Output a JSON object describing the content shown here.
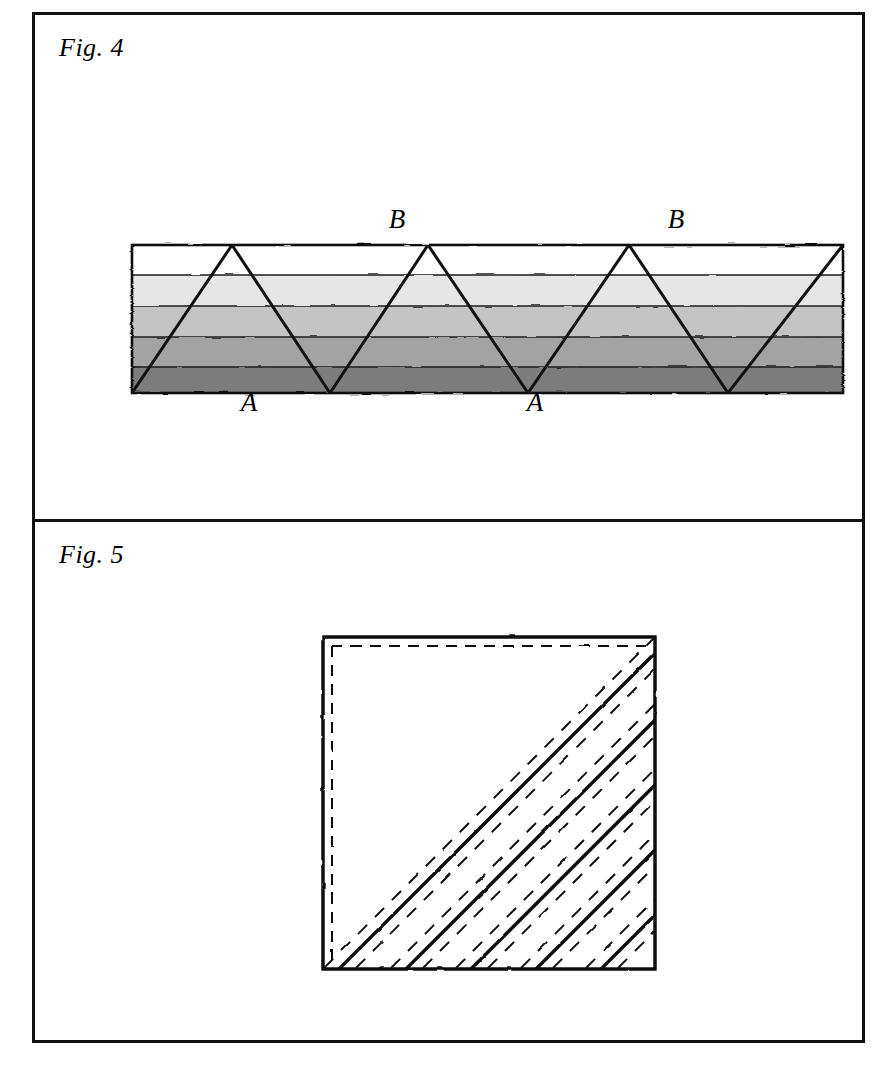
{
  "plate": {
    "background_color": "#ffffff",
    "border_color": "#111111"
  },
  "figures": [
    {
      "id": "fig4",
      "caption": "Fig. 4",
      "description": "Horizontal layered band with five grey-scale strata crossed by a zigzag (sawtooth) trace",
      "labels": [
        {
          "text": "B",
          "role": "crest-label",
          "x": 368,
          "y": 213
        },
        {
          "text": "B",
          "role": "crest-label",
          "x": 645,
          "y": 213
        },
        {
          "text": "A",
          "role": "trough-label",
          "x": 216,
          "y": 392
        },
        {
          "text": "A",
          "role": "trough-label",
          "x": 500,
          "y": 392
        }
      ],
      "band": {
        "left": 97,
        "right": 808,
        "top": 230,
        "bottom": 378,
        "stripes": [
          {
            "name": "stratum-1",
            "color": "#ffffff",
            "top": 230,
            "bottom": 260
          },
          {
            "name": "stratum-2",
            "color": "#e6e6e6",
            "top": 260,
            "bottom": 291
          },
          {
            "name": "stratum-3",
            "color": "#c4c4c4",
            "top": 291,
            "bottom": 322
          },
          {
            "name": "stratum-4",
            "color": "#a3a3a3",
            "top": 322,
            "bottom": 352
          },
          {
            "name": "stratum-5",
            "color": "#7d7d7d",
            "top": 352,
            "bottom": 378
          }
        ]
      },
      "zigzag": {
        "stroke_color": "#111111",
        "stroke_width": 3,
        "points": "97,378 197,230 295,378 393,230 493,378 594,230 693,378 808,230"
      }
    },
    {
      "id": "fig5",
      "caption": "Fig. 5",
      "description": "Square outline with an inset dashed margin along the top and left edges and a family of solid 45 degree diagonals each flanked by dashed diagonals",
      "square": {
        "left": 288,
        "top": 115,
        "size": 332,
        "stroke_color": "#111111",
        "stroke_width": 3
      },
      "inner_dashed_margin": {
        "inset": 9,
        "stroke_color": "#111111",
        "stroke_width": 2,
        "dash_pattern": "11 8",
        "edges": [
          "top",
          "left"
        ]
      },
      "diagonals": {
        "angle_degrees": 45,
        "direction": "lower-left to upper-right",
        "solid_count": 5,
        "solid_stroke_color": "#111111",
        "solid_stroke_width": 3.4,
        "dashed_stroke_color": "#111111",
        "dashed_stroke_width": 2,
        "dash_pattern": "13 11",
        "dashed_offsets": [
          -16,
          16
        ]
      }
    }
  ]
}
